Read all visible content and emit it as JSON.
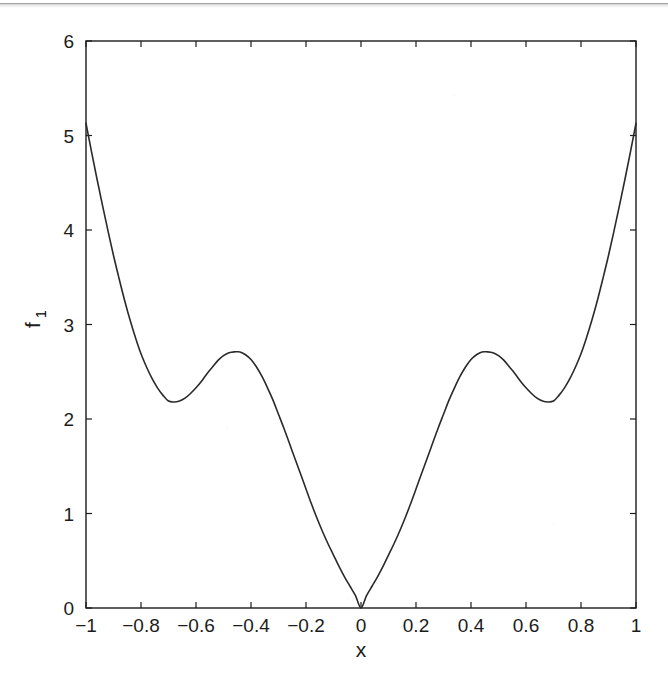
{
  "figure": {
    "background_color": "#ffffff",
    "line_color": "#2a2a2a",
    "axis_color": "#1c1c1c",
    "scan_artifact": "horizontal-scan-line"
  },
  "chart_data": {
    "type": "line",
    "title": "",
    "xlabel": "x",
    "ylabel": "f",
    "ylabel_subscript": "1",
    "xlim": [
      -1,
      1
    ],
    "ylim": [
      0,
      6
    ],
    "grid": false,
    "legend": null,
    "xticks": [
      -1,
      -0.8,
      -0.6,
      -0.4,
      -0.2,
      0,
      0.2,
      0.4,
      0.6,
      0.8,
      1
    ],
    "xticklabels": [
      "-1",
      "-0.8",
      "-0.6",
      "-0.4",
      "-0.2",
      "0",
      "0.2",
      "0.4",
      "0.6",
      "0.8",
      "1"
    ],
    "yticks": [
      0,
      1,
      2,
      3,
      4,
      5,
      6
    ],
    "yticklabels": [
      "0",
      "1",
      "2",
      "3",
      "4",
      "5",
      "6"
    ],
    "annotations": [
      {
        "name": "global-minimum",
        "x": 0.0,
        "y": 0.0
      },
      {
        "name": "local-maximum-left",
        "x": -0.45,
        "y": 2.71
      },
      {
        "name": "local-minimum-left",
        "x": -0.7,
        "y": 2.18
      },
      {
        "name": "local-maximum-right",
        "x": 0.45,
        "y": 2.71
      },
      {
        "name": "local-minimum-right",
        "x": 0.7,
        "y": 2.18
      },
      {
        "name": "left-endpoint",
        "x": -1.0,
        "y": 5.13
      },
      {
        "name": "right-endpoint",
        "x": 1.0,
        "y": 5.13
      }
    ],
    "series": [
      {
        "name": "f1",
        "x": [
          -1.0,
          -0.98,
          -0.96,
          -0.94,
          -0.92,
          -0.9,
          -0.88,
          -0.86,
          -0.84,
          -0.82,
          -0.8,
          -0.78,
          -0.76,
          -0.74,
          -0.72,
          -0.7,
          -0.68,
          -0.66,
          -0.64,
          -0.62,
          -0.6,
          -0.58,
          -0.56,
          -0.54,
          -0.52,
          -0.5,
          -0.48,
          -0.46,
          -0.44,
          -0.42,
          -0.4,
          -0.38,
          -0.36,
          -0.34,
          -0.32,
          -0.3,
          -0.28,
          -0.26,
          -0.24,
          -0.22,
          -0.2,
          -0.18,
          -0.16,
          -0.14,
          -0.12,
          -0.1,
          -0.08,
          -0.06,
          -0.04,
          -0.02,
          0.0,
          0.02,
          0.04,
          0.06,
          0.08,
          0.1,
          0.12,
          0.14,
          0.16,
          0.18,
          0.2,
          0.22,
          0.24,
          0.26,
          0.28,
          0.3,
          0.32,
          0.34,
          0.36,
          0.38,
          0.4,
          0.42,
          0.44,
          0.46,
          0.48,
          0.5,
          0.52,
          0.54,
          0.56,
          0.58,
          0.6,
          0.62,
          0.64,
          0.66,
          0.68,
          0.7,
          0.72,
          0.74,
          0.76,
          0.78,
          0.8,
          0.82,
          0.84,
          0.86,
          0.88,
          0.9,
          0.92,
          0.94,
          0.96,
          0.98,
          1.0
        ],
        "y": [
          5.13,
          4.83,
          4.54,
          4.26,
          3.99,
          3.73,
          3.49,
          3.26,
          3.05,
          2.86,
          2.69,
          2.55,
          2.43,
          2.33,
          2.25,
          2.19,
          2.18,
          2.19,
          2.22,
          2.27,
          2.33,
          2.4,
          2.48,
          2.55,
          2.62,
          2.67,
          2.7,
          2.71,
          2.71,
          2.68,
          2.63,
          2.55,
          2.45,
          2.33,
          2.2,
          2.05,
          1.9,
          1.74,
          1.58,
          1.42,
          1.26,
          1.1,
          0.95,
          0.81,
          0.68,
          0.56,
          0.44,
          0.33,
          0.23,
          0.13,
          0.0,
          0.13,
          0.23,
          0.33,
          0.44,
          0.56,
          0.68,
          0.81,
          0.95,
          1.1,
          1.26,
          1.42,
          1.58,
          1.74,
          1.9,
          2.05,
          2.2,
          2.33,
          2.45,
          2.55,
          2.63,
          2.68,
          2.71,
          2.71,
          2.7,
          2.67,
          2.62,
          2.55,
          2.48,
          2.4,
          2.33,
          2.27,
          2.22,
          2.19,
          2.18,
          2.19,
          2.25,
          2.33,
          2.43,
          2.55,
          2.69,
          2.86,
          3.05,
          3.26,
          3.49,
          3.73,
          3.99,
          4.26,
          4.54,
          4.83,
          5.13
        ]
      }
    ]
  }
}
